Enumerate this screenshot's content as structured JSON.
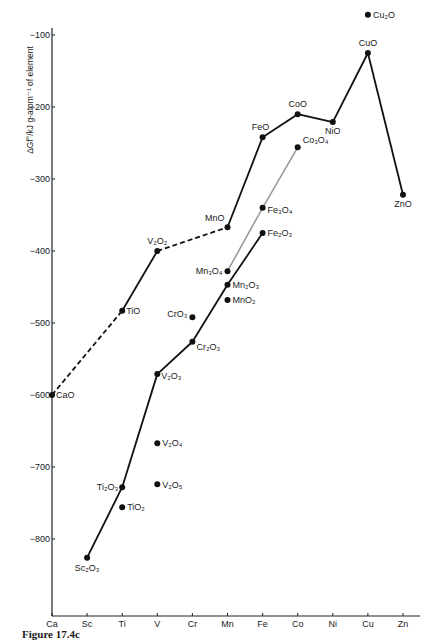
{
  "caption": "Figure 17.4c",
  "chart_data": {
    "type": "line",
    "title": "",
    "xlabel": "",
    "ylabel": "ΔGf°/kJ g-atom⁻¹ of element",
    "categories": [
      "Ca",
      "Sc",
      "Ti",
      "V",
      "Cr",
      "Mn",
      "Fe",
      "Co",
      "Ni",
      "Cu",
      "Zn"
    ],
    "ylim": [
      -900,
      -100
    ],
    "yticks": [
      -100,
      -200,
      -300,
      -400,
      -500,
      -600,
      -700,
      -800
    ],
    "grid": false,
    "legend": null,
    "series": [
      {
        "name": "MO (monoxides)",
        "style": "solid-black",
        "points": [
          {
            "x": "V",
            "label": "V₂O₂",
            "value": -400
          },
          {
            "x": "Mn",
            "label": "MnO",
            "value": -367
          },
          {
            "x": "Fe",
            "label": "FeO",
            "value": -242
          },
          {
            "x": "Co",
            "label": "CoO",
            "value": -210
          },
          {
            "x": "Ni",
            "label": "NiO",
            "value": -221
          },
          {
            "x": "Cu",
            "label": "CuO",
            "value": -125
          },
          {
            "x": "Zn",
            "label": "ZnO",
            "value": -322
          }
        ]
      },
      {
        "name": "MO dashed/solid early",
        "style": "mixed",
        "points": [
          {
            "x": "Ca",
            "label": "CaO",
            "value": -600
          },
          {
            "x": "Ti",
            "label": "TiO",
            "value": -483
          },
          {
            "x": "V",
            "label": "V₂O₂",
            "value": -400
          }
        ]
      },
      {
        "name": "M2O3 (sesquioxides)",
        "style": "solid-black",
        "points": [
          {
            "x": "Sc",
            "label": "Sc₂O₃",
            "value": -826
          },
          {
            "x": "Ti",
            "label": "Ti₂O₃",
            "value": -728
          },
          {
            "x": "V",
            "label": "V₂O₃",
            "value": -571
          },
          {
            "x": "Cr",
            "label": "Cr₂O₃",
            "value": -526
          },
          {
            "x": "Mn",
            "label": "Mn₂O₃",
            "value": -447
          },
          {
            "x": "Fe",
            "label": "Fe₂O₃",
            "value": -375
          }
        ]
      },
      {
        "name": "M3O4 (spinels)",
        "style": "solid-grey",
        "points": [
          {
            "x": "Mn",
            "label": "Mn₃O₄",
            "value": -428
          },
          {
            "x": "Fe",
            "label": "Fe₃O₄",
            "value": -340
          },
          {
            "x": "Co",
            "label": "Co₃O₄",
            "value": -256
          }
        ]
      },
      {
        "name": "Isolated oxides",
        "style": "points-only",
        "points": [
          {
            "x": "Ti",
            "label": "TiO₂",
            "value": -756
          },
          {
            "x": "V",
            "label": "V₂O₄",
            "value": -667
          },
          {
            "x": "V",
            "label": "V₂O₅",
            "value": -724
          },
          {
            "x": "Cr",
            "label": "CrO₃",
            "value": -492
          },
          {
            "x": "Mn",
            "label": "MnO₂",
            "value": -468
          },
          {
            "x": "Cu",
            "label": "Cu₂O",
            "value": -72
          }
        ]
      }
    ]
  }
}
